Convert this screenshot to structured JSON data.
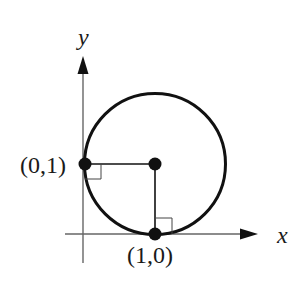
{
  "diagram": {
    "axes": {
      "x_label": "x",
      "y_label": "y"
    },
    "circle": {
      "description": "circle tangent to both axes, center (1,1), radius 1"
    },
    "points": [
      {
        "id": "p01",
        "label": "(0,1)"
      },
      {
        "id": "center",
        "label": ""
      },
      {
        "id": "p10",
        "label": "(1,0)"
      }
    ],
    "right_angle_markers": [
      {
        "at": "(0,1)"
      },
      {
        "at": "(1,0)"
      }
    ],
    "colors": {
      "stroke": "#111111",
      "axis": "#555555",
      "background": "#ffffff"
    }
  }
}
